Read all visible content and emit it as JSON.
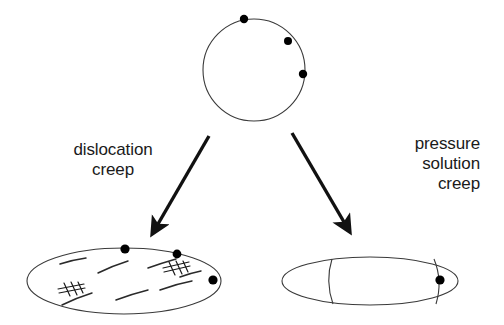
{
  "figure": {
    "width": 504,
    "height": 325,
    "background_color": "#ffffff",
    "line_color": "#3a3a3a",
    "marker_color": "#000000",
    "text_color": "#1a1a1a"
  },
  "labels": {
    "dislocation_creep": "dislocation\ncreep",
    "pressure_solution_creep": "pressure\nsolution\ncreep"
  },
  "shapes": {
    "initial_grain": {
      "name": "undeformed-circular-grain",
      "type": "circle",
      "cx": 254,
      "cy": 70,
      "r": 51,
      "markers": [
        {
          "cx": 244,
          "cy": 19,
          "r": 4.2
        },
        {
          "cx": 288,
          "cy": 41,
          "r": 4.0
        },
        {
          "cx": 303,
          "cy": 74,
          "r": 4.2
        }
      ]
    },
    "dislocation_grain": {
      "name": "flattened-grain-with-dislocations",
      "type": "ellipse",
      "cx": 124,
      "cy": 281,
      "rx": 97,
      "ry": 33,
      "markers": [
        {
          "cx": 125,
          "cy": 249,
          "r": 4.6
        },
        {
          "cx": 177,
          "cy": 254,
          "r": 4.4
        },
        {
          "cx": 213,
          "cy": 280,
          "r": 4.6
        }
      ],
      "dislocation_curves": [
        "M 60 264 Q 72 260 86 258",
        "M 98 273 Q 112 266 128 261",
        "M 148 268 Q 162 263 176 259",
        "M 62 305 Q 76 298 92 293",
        "M 116 300 Q 132 294 148 290",
        "M 160 290 Q 176 284 192 281",
        "M 178 276 Q 190 272 200 270"
      ],
      "dislocation_hatches": [
        {
          "x": 70,
          "y": 288,
          "angle": -22,
          "strokes": 4
        },
        {
          "x": 175,
          "y": 266,
          "angle": -24,
          "strokes": 4
        }
      ]
    },
    "pressure_solution_grain": {
      "name": "grain-with-solution-boundaries",
      "type": "ellipse",
      "cx": 370,
      "cy": 281,
      "rx": 88,
      "ry": 24,
      "markers": [
        {
          "cx": 440,
          "cy": 280,
          "r": 4.6
        }
      ],
      "boundary_curves": [
        "M 332 259 Q 325 281 333 304",
        "M 434 259 Q 443 281 436 304"
      ]
    }
  },
  "arrows": [
    {
      "name": "arrow-to-dislocation-creep",
      "x1": 209,
      "y1": 136,
      "x2": 158,
      "y2": 224
    },
    {
      "name": "arrow-to-pressure-solution-creep",
      "x1": 292,
      "y1": 133,
      "x2": 344,
      "y2": 222
    }
  ]
}
